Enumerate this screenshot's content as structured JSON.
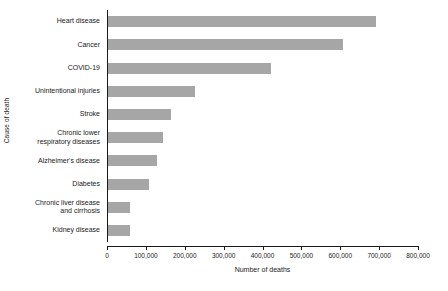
{
  "chart_data": {
    "type": "bar",
    "orientation": "horizontal",
    "title": "",
    "xlabel": "Number of deaths",
    "ylabel": "Cause of death",
    "categories": [
      "Heart disease",
      "Cancer",
      "COVID-19",
      "Unintentional injuries",
      "Stroke",
      "Chronic lower\nrespiratory diseases",
      "Alzheimer's disease",
      "Diabetes",
      "Chronic liver disease\nand cirrhosis",
      "Kidney disease"
    ],
    "values": [
      690000,
      604000,
      420000,
      224000,
      162000,
      142000,
      127000,
      106000,
      56000,
      56000
    ],
    "xlim": [
      0,
      800000
    ],
    "xticks": [
      0,
      100000,
      200000,
      300000,
      400000,
      500000,
      600000,
      700000,
      800000
    ],
    "xticklabels": [
      "0",
      "100,000",
      "200,000",
      "300,000",
      "400,000",
      "500,000",
      "600,000",
      "700,000",
      "800,000"
    ],
    "grid": false,
    "legend": null,
    "bar_color": "#a6a6a6",
    "axis_color": "#1a1a1a",
    "background_color": "#ffffff"
  }
}
